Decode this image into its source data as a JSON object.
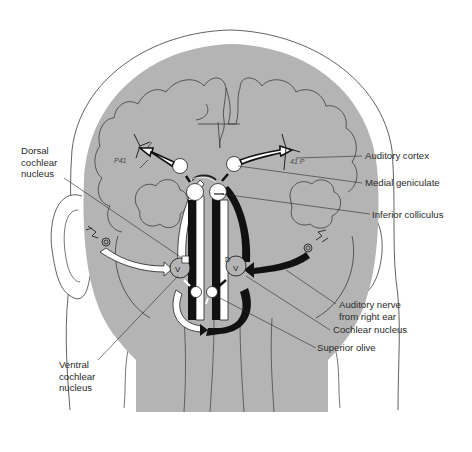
{
  "diagram": {
    "colors": {
      "background": "#ffffff",
      "tissue_gray": "#b4b4b4",
      "outline": "#3a3a3a",
      "left_pathway": "#ffffff",
      "right_pathway": "#111111",
      "label_text": "#2a2a2a"
    },
    "hand_annotations": {
      "left_cortex": "P41",
      "right_cortex": "41 P"
    },
    "nucleus_letters": {
      "ventral": "V",
      "dorsal": "D"
    }
  },
  "labels": {
    "dorsal_cochlear_nucleus": [
      "Dorsal",
      "cochlear",
      "nucleus"
    ],
    "auditory_cortex": "Auditory cortex",
    "medial_geniculate": "Medial geniculate",
    "inferior_colliculus": "Inferior colliculus",
    "auditory_nerve": [
      "Auditory nerve",
      "from right ear"
    ],
    "cochlear_nucleus": "Cochlear nucleus",
    "superior_olive": "Superior olive",
    "ventral_cochlear_nucleus": [
      "Ventral",
      "cochlear",
      "nucleus"
    ]
  }
}
